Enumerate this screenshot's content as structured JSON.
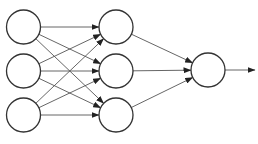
{
  "diagram": {
    "type": "neural-network",
    "colors": {
      "node_stroke": "#333333",
      "edge_stroke": "#555555",
      "background": "#ffffff"
    },
    "layers": [
      {
        "name": "input",
        "nodes": [
          {
            "id": "i1",
            "cx": 23.5,
            "cy": 27
          },
          {
            "id": "i2",
            "cx": 23.5,
            "cy": 71
          },
          {
            "id": "i3",
            "cx": 23.5,
            "cy": 115
          }
        ]
      },
      {
        "name": "hidden",
        "nodes": [
          {
            "id": "h1",
            "cx": 116,
            "cy": 27
          },
          {
            "id": "h2",
            "cx": 116,
            "cy": 71
          },
          {
            "id": "h3",
            "cx": 116,
            "cy": 115
          }
        ]
      },
      {
        "name": "output",
        "nodes": [
          {
            "id": "o1",
            "cx": 208,
            "cy": 70
          }
        ]
      }
    ],
    "radius": 17,
    "output_arrow": {
      "x1": 225,
      "y1": 70,
      "x2": 255,
      "y2": 70
    }
  }
}
